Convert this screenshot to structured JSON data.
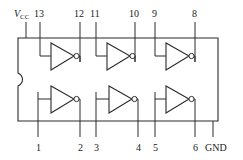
{
  "diagram": {
    "package": {
      "name": "dip-package-body",
      "notch": "left-edge-key-notch"
    },
    "colors": {
      "line": "#2b2b2b",
      "text": "#1a1a1a",
      "background": "#ffffff"
    },
    "top_labels": [
      {
        "id": "vcc",
        "text": "V",
        "sub": "CC",
        "x": 14,
        "y": 9,
        "lead_x": 26
      },
      {
        "id": "p13",
        "text": "13",
        "x": 34,
        "y": 9,
        "lead_x": 40
      },
      {
        "id": "p12",
        "text": "12",
        "x": 74,
        "y": 9,
        "lead_x": 80
      },
      {
        "id": "p11",
        "text": "11",
        "x": 90,
        "y": 9,
        "lead_x": 96
      },
      {
        "id": "p10",
        "text": "10",
        "x": 129,
        "y": 9,
        "lead_x": 135
      },
      {
        "id": "p9",
        "text": "9",
        "x": 152,
        "y": 9,
        "lead_x": 155
      },
      {
        "id": "p8",
        "text": "8",
        "x": 192,
        "y": 9,
        "lead_x": 195
      }
    ],
    "bottom_labels": [
      {
        "id": "p1",
        "text": "1",
        "x": 36,
        "y": 143,
        "lead_x": 38
      },
      {
        "id": "p2",
        "text": "2",
        "x": 78,
        "y": 143,
        "lead_x": 80
      },
      {
        "id": "p3",
        "text": "3",
        "x": 94,
        "y": 143,
        "lead_x": 96
      },
      {
        "id": "p4",
        "text": "4",
        "x": 136,
        "y": 143,
        "lead_x": 138
      },
      {
        "id": "p5",
        "text": "5",
        "x": 153,
        "y": 143,
        "lead_x": 155
      },
      {
        "id": "p6",
        "text": "6",
        "x": 193,
        "y": 143,
        "lead_x": 195
      },
      {
        "id": "gnd",
        "text": "GND",
        "x": 206,
        "y": 143,
        "lead_x": 213
      }
    ],
    "gates": [
      {
        "id": "inverter-1",
        "row": "top",
        "input_pin": "13",
        "output_pin": "12"
      },
      {
        "id": "inverter-2",
        "row": "top",
        "input_pin": "11",
        "output_pin": "10"
      },
      {
        "id": "inverter-3",
        "row": "top",
        "input_pin": "9",
        "output_pin": "8"
      },
      {
        "id": "inverter-4",
        "row": "bottom",
        "input_pin": "1",
        "output_pin": "2"
      },
      {
        "id": "inverter-5",
        "row": "bottom",
        "input_pin": "3",
        "output_pin": "4"
      },
      {
        "id": "inverter-6",
        "row": "bottom",
        "input_pin": "5",
        "output_pin": "6"
      }
    ]
  }
}
